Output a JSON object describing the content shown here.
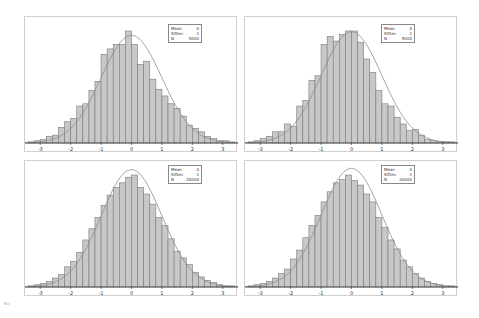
{
  "corner_label": "N=",
  "chart_data": [
    {
      "type": "bar",
      "title": "",
      "xlabel": "",
      "ylabel": "",
      "xlim": [
        -3.5,
        3.5
      ],
      "xticks": [
        "-3",
        "-2",
        "-1",
        "0",
        "1",
        "2",
        "3"
      ],
      "bin_start": -3.4,
      "bin_width": 0.2,
      "overlay": "normal density curve (mean 0, sd 1)",
      "legend": {
        "Mean": "0",
        "StDev": "1",
        "N": "5000"
      },
      "values": [
        1,
        2,
        3,
        6,
        7,
        14,
        19,
        22,
        33,
        35,
        47,
        55,
        79,
        84,
        88,
        88,
        100,
        88,
        70,
        73,
        57,
        48,
        42,
        35,
        31,
        24,
        16,
        13,
        10,
        6,
        4,
        2,
        2,
        1
      ]
    },
    {
      "type": "bar",
      "title": "",
      "xlabel": "",
      "ylabel": "",
      "xlim": [
        -3.5,
        3.5
      ],
      "xticks": [
        "-3",
        "-2",
        "-1",
        "0",
        "1",
        "2",
        "3"
      ],
      "bin_start": -3.4,
      "bin_width": 0.2,
      "overlay": "normal density curve (mean 0, sd 1)",
      "legend": {
        "Mean": "0",
        "StDev": "1",
        "N": "5000"
      },
      "values": [
        1,
        2,
        4,
        6,
        10,
        10,
        17,
        15,
        33,
        38,
        56,
        60,
        88,
        95,
        91,
        97,
        100,
        100,
        90,
        75,
        63,
        47,
        35,
        33,
        23,
        17,
        11,
        12,
        7,
        3,
        2,
        1,
        1,
        1
      ]
    },
    {
      "type": "bar",
      "title": "",
      "xlabel": "",
      "ylabel": "",
      "xlim": [
        -3.5,
        3.5
      ],
      "xticks": [
        "-3",
        "-2",
        "-1",
        "0",
        "1",
        "2",
        "3"
      ],
      "bin_start": -3.4,
      "bin_width": 0.2,
      "overlay": "normal density curve (mean 0, sd 1)",
      "legend": {
        "Mean": "0",
        "StDev": "1",
        "N": "20000"
      },
      "values": [
        1,
        2,
        3,
        5,
        8,
        11,
        18,
        23,
        31,
        42,
        52,
        62,
        73,
        82,
        89,
        93,
        98,
        100,
        89,
        83,
        74,
        62,
        55,
        43,
        32,
        26,
        20,
        13,
        9,
        6,
        4,
        2,
        1,
        1
      ]
    },
    {
      "type": "bar",
      "title": "",
      "xlabel": "",
      "ylabel": "",
      "xlim": [
        -3.5,
        3.5
      ],
      "xticks": [
        "-3",
        "-2",
        "-1",
        "0",
        "1",
        "2",
        "3"
      ],
      "bin_start": -3.4,
      "bin_width": 0.2,
      "overlay": "normal density curve (mean 0, sd 1)",
      "legend": {
        "Mean": "0",
        "StDev": "1",
        "N": "20000"
      },
      "values": [
        1,
        2,
        3,
        5,
        8,
        12,
        16,
        25,
        33,
        44,
        55,
        64,
        76,
        85,
        93,
        96,
        100,
        95,
        91,
        83,
        76,
        62,
        53,
        42,
        34,
        24,
        18,
        12,
        8,
        5,
        3,
        2,
        1,
        1
      ]
    }
  ],
  "legend_labels": {
    "mean": "Mean",
    "stdev": "StDev",
    "n": "N"
  }
}
